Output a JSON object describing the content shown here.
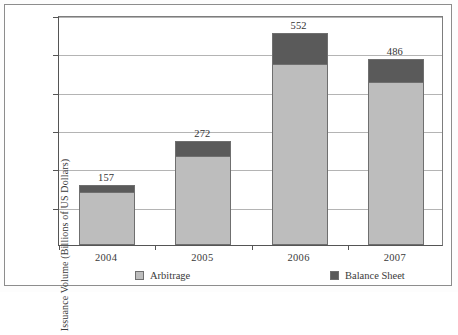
{
  "chart_data": {
    "type": "bar",
    "subtype": "stacked",
    "title": "",
    "xlabel": "",
    "ylabel": "Issuance Volume (Billions of US Dollars)",
    "categories": [
      "2004",
      "2005",
      "2006",
      "2007"
    ],
    "series": [
      {
        "name": "Arbitrage",
        "color": "#bdbdbd",
        "values": [
          139,
          232,
          472,
          426
        ]
      },
      {
        "name": "Balance Sheet",
        "color": "#5a5a5a",
        "values": [
          18,
          40,
          80,
          60
        ]
      }
    ],
    "totals": [
      157,
      272,
      552,
      486
    ],
    "total_labels": [
      "157",
      "272",
      "552",
      "486"
    ],
    "ylim": [
      0,
      600
    ],
    "yticks": [
      100,
      200,
      300,
      400,
      500,
      600
    ],
    "ytick_labels": [
      "100",
      "200",
      "300",
      "400",
      "500",
      "600"
    ],
    "grid": true,
    "legend_position": "bottom"
  },
  "legend": {
    "items": [
      {
        "label": "Arbitrage",
        "color": "#bdbdbd"
      },
      {
        "label": "Balance Sheet",
        "color": "#5a5a5a"
      }
    ]
  }
}
